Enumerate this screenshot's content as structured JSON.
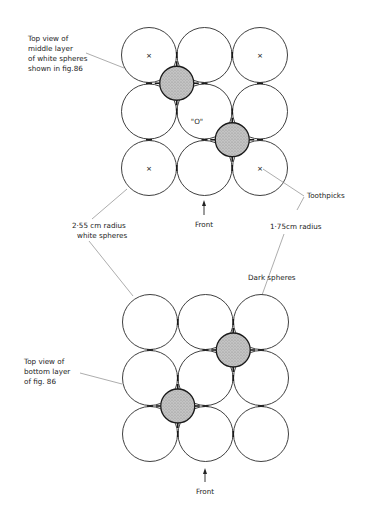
{
  "figure": {
    "top_panel": {
      "title_label": [
        "Top view of",
        "middle layer",
        "of white spheres",
        "shown in fig.86"
      ],
      "center_label": "\"O\"",
      "front_label": "Front",
      "grid": {
        "rows": 3,
        "cols": 3,
        "marked_cells": [
          [
            0,
            0
          ],
          [
            0,
            2
          ],
          [
            2,
            0
          ],
          [
            2,
            2
          ]
        ],
        "mark_glyph": "×"
      },
      "dark_spheres_at_gaps": [
        [
          0,
          0
        ],
        [
          1,
          1
        ]
      ]
    },
    "bottom_panel": {
      "title_label": [
        "Top view of",
        "bottom layer",
        "of fig. 86"
      ],
      "front_label": "Front",
      "grid": {
        "rows": 3,
        "cols": 3
      },
      "dark_spheres_at_gaps": [
        [
          0,
          1
        ],
        [
          1,
          0
        ]
      ]
    },
    "annotations": {
      "white_spheres": [
        "2·55 cm radius",
        "white spheres"
      ],
      "toothpicks": "Toothpicks",
      "dark_radius": "1·75cm radius",
      "dark_spheres": "Dark spheres"
    },
    "colors": {
      "white_sphere_fill": "#ffffff",
      "dark_sphere_fill": "#b8b8b8",
      "outline": "#2a2a2a",
      "leader": "#8a8a8a"
    }
  }
}
